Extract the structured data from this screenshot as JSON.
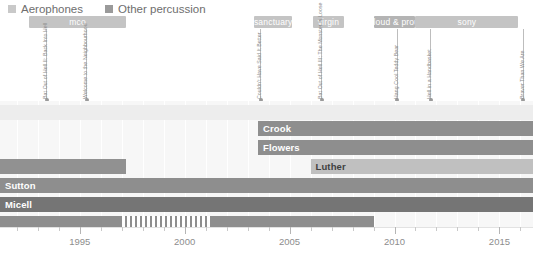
{
  "legend": {
    "entries": [
      {
        "label": "Aerophones",
        "color": "#c9c9c9"
      },
      {
        "label": "Other percussion",
        "color": "#9a9a9a"
      }
    ]
  },
  "axis": {
    "xmin": 1991.2,
    "xmax": 2016.6,
    "major_ticks": [
      1995,
      2000,
      2005,
      2010,
      2015
    ],
    "major_labels": [
      "1995",
      "2000",
      "2005",
      "2010",
      "2015"
    ],
    "minor_step": 1
  },
  "eras": [
    {
      "label": "mco",
      "start": 1992.6,
      "end": 1997.2,
      "color": "#c4c4c4"
    },
    {
      "label": "sanctuary",
      "start": 2003.3,
      "end": 2005.1,
      "color": "#c4c4c4"
    },
    {
      "label": "virgin",
      "start": 2006.1,
      "end": 2007.6,
      "color": "#c4c4c4"
    },
    {
      "label": "loud & proud",
      "start": 2009.0,
      "end": 2011.0,
      "color": "#b4b4b4"
    },
    {
      "label": "sony",
      "start": 2011.0,
      "end": 2015.9,
      "color": "#c4c4c4"
    }
  ],
  "events": [
    {
      "title": "Bat Out of Hell II: Back Into Hell",
      "year": 1993.4
    },
    {
      "title": "Welcome to the Neighbourhood",
      "year": 1995.3
    },
    {
      "title": "Couldn't Have Said It Better",
      "year": 2003.6
    },
    {
      "title": "Bat Out of Hell III: The Monster Is Loose",
      "year": 2006.5
    },
    {
      "title": "Hang Cool Teddy Bear",
      "year": 2010.1
    },
    {
      "title": "Hell in a Handbasket",
      "year": 2011.7
    },
    {
      "title": "Braver Than We Are",
      "year": 2016.1
    }
  ],
  "chart_data": {
    "type": "bar",
    "title": "",
    "xlabel": "",
    "ylabel": "",
    "orientation": "horizontal",
    "xlim": [
      1991.2,
      2016.6
    ],
    "grid": true,
    "legend_position": "top-left",
    "series": [
      {
        "name": "Aerophones",
        "color": "#c9c9c9"
      },
      {
        "name": "Other percussion",
        "color": "#9a9a9a"
      }
    ],
    "bars": [
      {
        "name": "",
        "label": "",
        "start": 1991.2,
        "end": 2016.6,
        "row": 0,
        "color": "#ededed",
        "label_color": "dark",
        "show_label": false
      },
      {
        "name": "Crook",
        "label": "Crook",
        "start": 2003.5,
        "end": 2016.6,
        "row": 1,
        "color": "#8e8e8e",
        "label_color": "light",
        "show_label": true
      },
      {
        "name": "Flowers",
        "label": "Flowers",
        "start": 2003.5,
        "end": 2016.6,
        "row": 2,
        "color": "#8e8e8e",
        "label_color": "light",
        "show_label": true
      },
      {
        "name": "unlabeled-early",
        "label": "",
        "start": 1991.2,
        "end": 1997.2,
        "row": 3,
        "color": "#919191",
        "label_color": "light",
        "show_label": false
      },
      {
        "name": "Luther",
        "label": "Luther",
        "start": 2006.0,
        "end": 2016.6,
        "row": 3,
        "color": "#c0c0c0",
        "label_color": "dark",
        "show_label": true
      },
      {
        "name": "Sutton",
        "label": "Sutton",
        "start": 1991.2,
        "end": 2016.6,
        "row": 4,
        "color": "#8e8e8e",
        "label_color": "light",
        "show_label": true
      },
      {
        "name": "Micell",
        "label": "Micell",
        "start": 1991.2,
        "end": 2016.6,
        "row": 5,
        "color": "#757575",
        "label_color": "light",
        "show_label": true
      },
      {
        "name": "bottom-left-solid",
        "label": "",
        "start": 1991.2,
        "end": 1996.9,
        "row": 6,
        "color": "#8e8e8e",
        "label_color": "light",
        "show_label": false
      },
      {
        "name": "bottom-hatched",
        "label": "",
        "start": 1996.9,
        "end": 2001.3,
        "row": 6,
        "color": "#8e8e8e",
        "label_color": "light",
        "show_label": false,
        "hatched": true
      },
      {
        "name": "bottom-right-solid",
        "label": "",
        "start": 2001.3,
        "end": 2009.0,
        "row": 6,
        "color": "#8e8e8e",
        "label_color": "light",
        "show_label": false
      }
    ]
  }
}
